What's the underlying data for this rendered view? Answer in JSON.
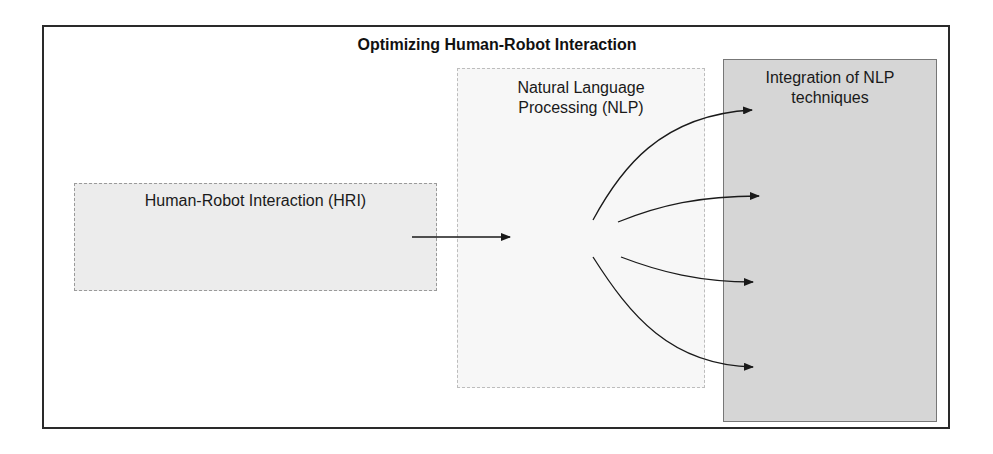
{
  "diagram": {
    "title": "Optimizing Human-Robot Interaction",
    "nodes": [
      {
        "id": "hri",
        "label": "Human-Robot Interaction (HRI)"
      },
      {
        "id": "nlp",
        "label_lines": [
          "Natural Language",
          "Processing (NLP)"
        ]
      },
      {
        "id": "integration",
        "label_lines": [
          "Integration of NLP",
          "techniques"
        ]
      }
    ],
    "edges": [
      {
        "from": "hri",
        "to": "nlp",
        "style": "straight-arrow"
      },
      {
        "from": "nlp",
        "to": "integration",
        "style": "curved-arrow",
        "target_slot": 1
      },
      {
        "from": "nlp",
        "to": "integration",
        "style": "curved-arrow",
        "target_slot": 2
      },
      {
        "from": "nlp",
        "to": "integration",
        "style": "curved-arrow",
        "target_slot": 3
      },
      {
        "from": "nlp",
        "to": "integration",
        "style": "curved-arrow",
        "target_slot": 4
      }
    ],
    "colors": {
      "frame_border": "#2a2a2a",
      "hri_fill": "#ececec",
      "nlp_fill": "#f7f7f7",
      "integration_fill": "#d6d6d6",
      "arrow": "#1a1a1a"
    }
  }
}
